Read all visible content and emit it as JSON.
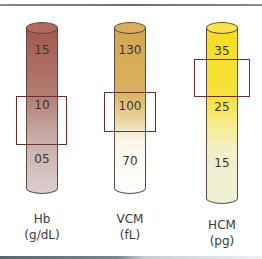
{
  "columns": [
    {
      "id": "hb",
      "name": "Hb",
      "unit": "(g/dL)",
      "ticks": [
        "15",
        "10",
        "05"
      ],
      "highlighted_value": "10",
      "gradient": [
        "#a4594f",
        "#c39a92",
        "#ddcfd0"
      ],
      "cap_color": "#b06a5f"
    },
    {
      "id": "vcm",
      "name": "VCM",
      "unit": "(fL)",
      "ticks": [
        "130",
        "100",
        "70"
      ],
      "highlighted_value": "100",
      "gradient": [
        "#d4a64f",
        "#e8cc86",
        "#ffffff"
      ],
      "cap_color": "#d9ae5c"
    },
    {
      "id": "hcm",
      "name": "HCM",
      "unit": "(pg)",
      "ticks": [
        "35",
        "25",
        "15"
      ],
      "highlighted_value": "between 35 and 25",
      "gradient": [
        "#f6e024",
        "#f6eb86",
        "#f0f2d8"
      ],
      "cap_color": "#f7e44a"
    }
  ],
  "colors": {
    "frame": "#6b2f2a",
    "outline": "#5a4a44"
  }
}
